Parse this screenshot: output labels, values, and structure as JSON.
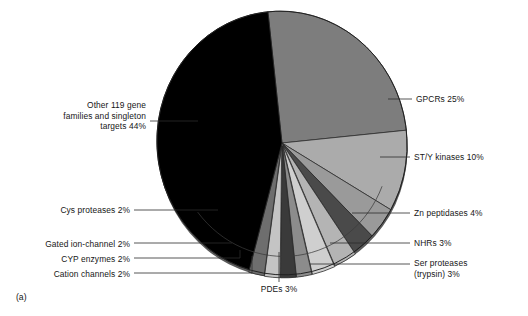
{
  "figure": {
    "panel_tag": "(a)",
    "background_color": "#ffffff",
    "text_color": "#161616"
  },
  "chart_data": {
    "type": "pie",
    "title": "",
    "subtitle": "",
    "xlabel": "",
    "ylabel": "",
    "legend_position": "none",
    "grid": false,
    "value_unit": "%",
    "total": 100,
    "categories": [
      "GPCRs",
      "ST/Y kinases",
      "Zn peptidases",
      "NHRs",
      "Ser proteases (trypsin)",
      "PDEs",
      "Cation channels",
      "CYP enzymes",
      "Gated ion-channel",
      "Cys proteases",
      "Other 119 gene families and singleton targets"
    ],
    "values": [
      25,
      10,
      4,
      3,
      3,
      3,
      2,
      2,
      2,
      2,
      44
    ],
    "colors": [
      "#7d7d7d",
      "#ababab",
      "#9a9a9a",
      "#4a4a4a",
      "#b4b4b4",
      "#cfcfcf",
      "#8c8c8c",
      "#3a3a3a",
      "#c4c4c4",
      "#6e6e6e",
      "#000000"
    ],
    "annotations": [
      {
        "label": "GPCRs 25%",
        "value": 25,
        "category": "GPCRs"
      },
      {
        "label": "ST/Y kinases 10%",
        "value": 10,
        "category": "ST/Y kinases"
      },
      {
        "label": "Zn peptidases 4%",
        "value": 4,
        "category": "Zn peptidases"
      },
      {
        "label": "NHRs 3%",
        "value": 3,
        "category": "NHRs"
      },
      {
        "label": "Ser proteases\n(trypsin) 3%",
        "value": 3,
        "category": "Ser proteases (trypsin)"
      },
      {
        "label": "PDEs 3%",
        "value": 3,
        "category": "PDEs"
      },
      {
        "label": "Cation channels 2%",
        "value": 2,
        "category": "Cation channels"
      },
      {
        "label": "CYP enzymes 2%",
        "value": 2,
        "category": "CYP enzymes"
      },
      {
        "label": "Gated ion-channel 2%",
        "value": 2,
        "category": "Gated ion-channel"
      },
      {
        "label": "Cys proteases 2%",
        "value": 2,
        "category": "Cys proteases"
      },
      {
        "label": "Other 119 gene\nfamilies and singleton\ntargets 44%",
        "value": 44,
        "category": "Other 119 gene families and singleton targets"
      }
    ]
  },
  "labels": {
    "gpcrs": "GPCRs 25%",
    "sty_kinases": "ST/Y kinases 10%",
    "zn_peptidases": "Zn peptidases 4%",
    "nhrs": "NHRs 3%",
    "ser_proteases": "Ser proteases\n(trypsin) 3%",
    "pdes": "PDEs 3%",
    "cation_channels": "Cation channels 2%",
    "cyp_enzymes": "CYP enzymes 2%",
    "gated_ion_channel": "Gated ion-channel 2%",
    "cys_proteases": "Cys proteases 2%",
    "other": "Other 119 gene\nfamilies and singleton\ntargets 44%"
  }
}
